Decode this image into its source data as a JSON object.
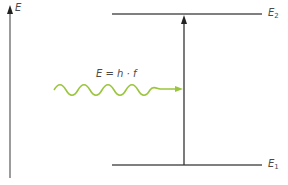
{
  "diagram": {
    "type": "energy-level-diagram",
    "axis_label": "E",
    "levels": [
      {
        "name": "E",
        "sub": "2",
        "y": 14
      },
      {
        "name": "E",
        "sub": "1",
        "y": 165
      }
    ],
    "photon": {
      "formula": "E = h · f",
      "color": "#9bc53d"
    },
    "transition": {
      "from": "E1",
      "to": "E2",
      "direction": "up"
    },
    "colors": {
      "line": "#555555",
      "axis": "#555555",
      "photon": "#9bc53d",
      "text": "#4a4a4a"
    }
  }
}
